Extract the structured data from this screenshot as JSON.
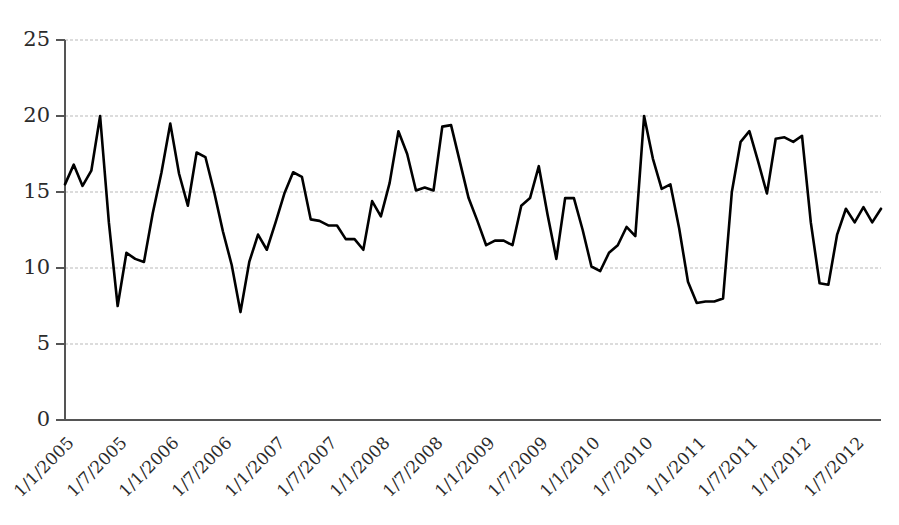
{
  "chart_data": {
    "type": "line",
    "title": "",
    "subtitle": "",
    "xlabel": "",
    "ylabel": "",
    "ylim": [
      0,
      25
    ],
    "yticks": [
      0,
      5,
      10,
      15,
      20,
      25
    ],
    "ytick_labels": [
      "0",
      "5",
      "10",
      "15",
      "20",
      "25"
    ],
    "grid": true,
    "grid_axis": "y",
    "legend": false,
    "legend_position": "none",
    "line_color": "#000000",
    "grid_color": "#b9b9b9",
    "axis_color": "#555555",
    "background_color": "#ffffff",
    "xtick_labels": [
      "1/1/2005",
      "1/7/2005",
      "1/1/2006",
      "1/7/2006",
      "1/1/2007",
      "1/7/2007",
      "1/1/2008",
      "1/7/2008",
      "1/1/2009",
      "1/7/2009",
      "1/1/2010",
      "1/7/2010",
      "1/1/2011",
      "1/7/2011",
      "1/1/2012",
      "1/7/2012"
    ],
    "xtick_rotation_deg": -45,
    "xtick_interval_months": 6,
    "x_start": "1/1/2005",
    "x_unit": "month",
    "series": [
      {
        "name": "series-1",
        "x": [
          "1/1/2005",
          "1/2/2005",
          "1/3/2005",
          "1/4/2005",
          "1/5/2005",
          "1/6/2005",
          "1/7/2005",
          "1/8/2005",
          "1/9/2005",
          "1/10/2005",
          "1/11/2005",
          "1/12/2005",
          "1/1/2006",
          "1/2/2006",
          "1/3/2006",
          "1/4/2006",
          "1/5/2006",
          "1/6/2006",
          "1/7/2006",
          "1/8/2006",
          "1/9/2006",
          "1/10/2006",
          "1/11/2006",
          "1/12/2006",
          "1/1/2007",
          "1/2/2007",
          "1/3/2007",
          "1/4/2007",
          "1/5/2007",
          "1/6/2007",
          "1/7/2007",
          "1/8/2007",
          "1/9/2007",
          "1/10/2007",
          "1/11/2007",
          "1/12/2007",
          "1/1/2008",
          "1/2/2008",
          "1/3/2008",
          "1/4/2008",
          "1/5/2008",
          "1/6/2008",
          "1/7/2008",
          "1/8/2008",
          "1/9/2008",
          "1/10/2008",
          "1/11/2008",
          "1/12/2008",
          "1/1/2009",
          "1/2/2009",
          "1/3/2009",
          "1/4/2009",
          "1/5/2009",
          "1/6/2009",
          "1/7/2009",
          "1/8/2009",
          "1/9/2009",
          "1/10/2009",
          "1/11/2009",
          "1/12/2009",
          "1/1/2010",
          "1/2/2010",
          "1/3/2010",
          "1/4/2010",
          "1/5/2010",
          "1/6/2010",
          "1/7/2010",
          "1/8/2010",
          "1/9/2010",
          "1/10/2010",
          "1/11/2010",
          "1/12/2010",
          "1/1/2011",
          "1/2/2011",
          "1/3/2011",
          "1/4/2011",
          "1/5/2011",
          "1/6/2011",
          "1/7/2011",
          "1/8/2011",
          "1/9/2011",
          "1/10/2011",
          "1/11/2011",
          "1/12/2011",
          "1/1/2012",
          "1/2/2012",
          "1/3/2012",
          "1/4/2012",
          "1/5/2012",
          "1/6/2012",
          "1/7/2012",
          "1/8/2012",
          "1/9/2012",
          "1/10/2012"
        ],
        "values": [
          15.5,
          16.8,
          15.4,
          16.4,
          20.0,
          13.0,
          7.5,
          11.0,
          10.6,
          10.4,
          13.6,
          16.3,
          19.5,
          16.2,
          14.1,
          17.6,
          17.3,
          15.0,
          12.4,
          10.2,
          7.1,
          10.4,
          12.2,
          11.2,
          13.0,
          14.9,
          16.3,
          16.0,
          13.2,
          13.1,
          12.8,
          12.8,
          11.9,
          11.9,
          11.2,
          14.4,
          13.4,
          15.6,
          19.0,
          17.5,
          15.1,
          15.3,
          15.1,
          19.3,
          19.4,
          17.0,
          14.6,
          13.1,
          11.5,
          11.8,
          11.8,
          11.5,
          14.1,
          14.6,
          16.7,
          13.5,
          10.6,
          14.6,
          14.6,
          12.5,
          10.1,
          9.8,
          11.0,
          11.5,
          12.7,
          12.1,
          20.0,
          17.2,
          15.2,
          15.5,
          12.6,
          9.1,
          7.7,
          7.8,
          7.8,
          8.0,
          15.0,
          18.3,
          19.0,
          17.0,
          14.9,
          18.5,
          18.6,
          18.3,
          18.7,
          13.0,
          9.0,
          8.9,
          12.2,
          13.9,
          13.0,
          14.0,
          13.0,
          13.9
        ]
      }
    ]
  }
}
